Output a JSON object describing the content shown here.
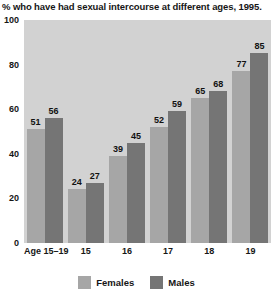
{
  "chart_data": {
    "type": "bar",
    "title": "% who have had sexual intercourse at different ages, 1995.",
    "xlabel": "",
    "ylabel": "",
    "ylim": [
      0,
      100
    ],
    "yticks": [
      0,
      20,
      40,
      60,
      80,
      100
    ],
    "grid": false,
    "legend_position": "bottom-center",
    "categories": [
      "Age 15–19",
      "15",
      "16",
      "17",
      "18",
      "19"
    ],
    "series": [
      {
        "name": "Females",
        "color": "#a6a6a6",
        "values": [
          51,
          24,
          39,
          52,
          65,
          77
        ]
      },
      {
        "name": "Males",
        "color": "#757575",
        "values": [
          56,
          27,
          45,
          59,
          68,
          85
        ]
      }
    ]
  },
  "colors": {
    "plot_background": "#d2d2d2",
    "page_background": "#ffffff",
    "females": "#a6a6a6",
    "males": "#757575",
    "text": "#161616"
  }
}
